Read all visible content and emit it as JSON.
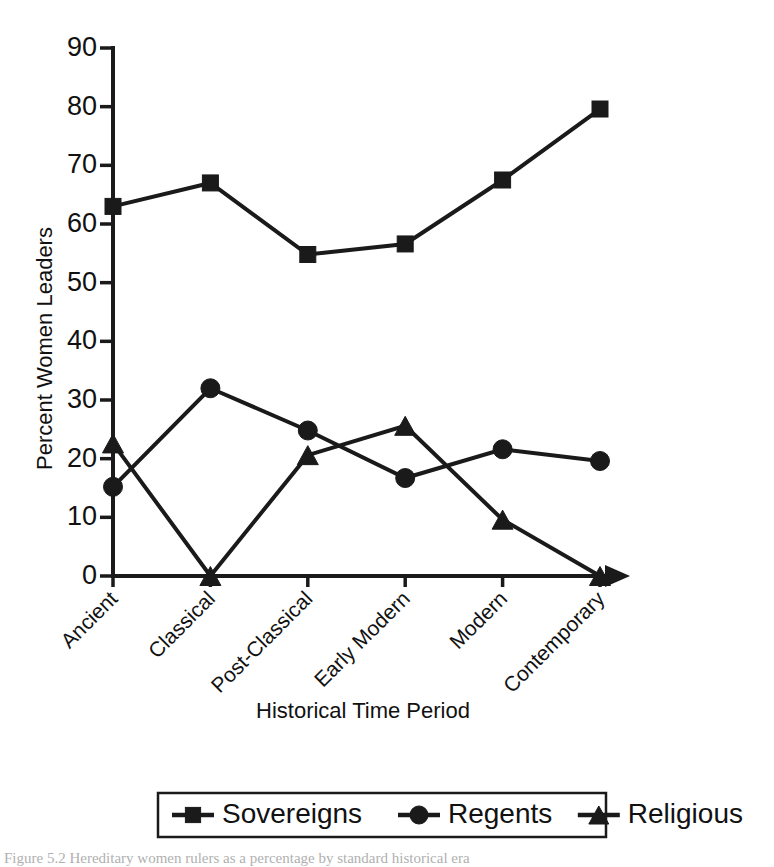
{
  "figure": {
    "background": "#ffffff",
    "ink_color": "#1a1a1a",
    "caption_text": "Figure 5.2 Hereditary women rulers as a percentage by standard historical era"
  },
  "chart_data": {
    "type": "line",
    "title": "",
    "xlabel": "Historical Time Period",
    "ylabel": "Percent Women Leaders",
    "categories": [
      "Ancient",
      "Classical",
      "Post-Classical",
      "Early Modern",
      "Modern",
      "Contemporary"
    ],
    "ylim": [
      0,
      90
    ],
    "yticks": [
      0,
      10,
      20,
      30,
      40,
      50,
      60,
      70,
      80,
      90
    ],
    "ytick_labels": [
      "0",
      "10",
      "20",
      "30",
      "40",
      "50",
      "60",
      "70",
      "80",
      "90"
    ],
    "grid": false,
    "legend_position": "bottom",
    "series": [
      {
        "name": "Sovereigns",
        "marker": "square",
        "values": [
          63.0,
          67.0,
          54.8,
          56.6,
          67.5,
          79.6
        ]
      },
      {
        "name": "Regents",
        "marker": "circle",
        "values": [
          15.2,
          32.0,
          24.8,
          16.7,
          21.6,
          19.6
        ]
      },
      {
        "name": "Religious",
        "marker": "triangle",
        "values": [
          22.6,
          0.0,
          20.6,
          25.6,
          9.6,
          0.0
        ]
      }
    ]
  },
  "legend": {
    "entries": [
      {
        "label": "Sovereigns",
        "marker": "square"
      },
      {
        "label": "Regents",
        "marker": "circle"
      },
      {
        "label": "Religious",
        "marker": "triangle"
      }
    ]
  },
  "axes": {
    "y_title": "Percent Women Leaders",
    "x_title": "Historical Time Period"
  }
}
